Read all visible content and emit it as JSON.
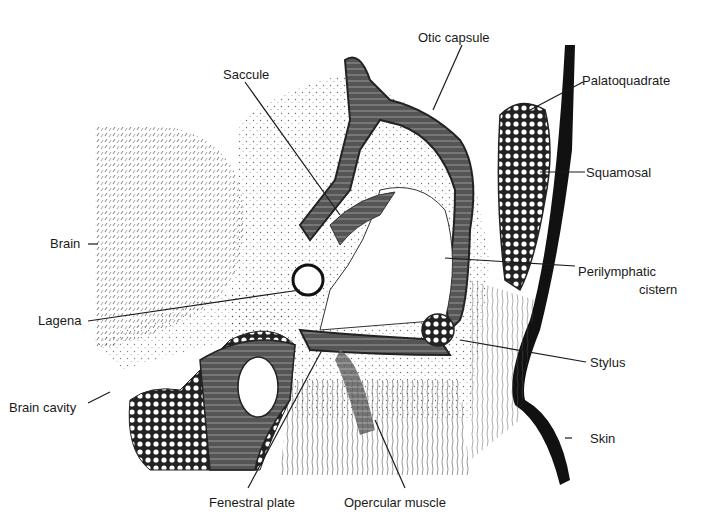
{
  "figure": {
    "labels": {
      "otic_capsule": "Otic capsule",
      "saccule": "Saccule",
      "palatoquadrate": "Palatoquadrate",
      "squamosal": "Squamosal",
      "brain": "Brain",
      "perilymphatic_1": "Perilymphatic",
      "perilymphatic_2": "cistern",
      "lagena": "Lagena",
      "stylus": "Stylus",
      "brain_cavity": "Brain cavity",
      "skin": "Skin",
      "fenestral_plate": "Fenestral plate",
      "opercular_muscle": "Opercular muscle"
    },
    "colors": {
      "ink": "#1a1a1a",
      "paper": "#ffffff"
    }
  }
}
